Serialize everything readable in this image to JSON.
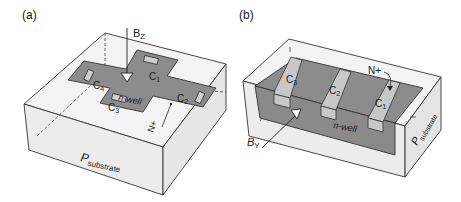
{
  "panels": [
    {
      "id": "a",
      "tag": "(a)",
      "field_label": "B",
      "field_sub": "Z",
      "well_label": "n-well",
      "substrate_label": "P",
      "substrate_sub": "substrate",
      "implant_label": "N+",
      "contacts": [
        {
          "label": "C",
          "sub": "1"
        },
        {
          "label": "C",
          "sub": "2"
        },
        {
          "label": "C",
          "sub": "3"
        },
        {
          "label": "C",
          "sub": "4"
        }
      ]
    },
    {
      "id": "b",
      "tag": "(b)",
      "field_label": "B",
      "field_sub": "Y",
      "well_label": "n-well",
      "substrate_label": "P",
      "substrate_sub": "substrate",
      "implant_label": "N+",
      "contacts": [
        {
          "label": "C",
          "sub": "3"
        },
        {
          "label": "C",
          "sub": "2"
        },
        {
          "label": "C",
          "sub": "1"
        }
      ]
    }
  ],
  "colors": {
    "substrate": "#f1f1f1",
    "well": "#8a8a8a",
    "implant": "#c4c4c4",
    "edge": "#333333"
  }
}
